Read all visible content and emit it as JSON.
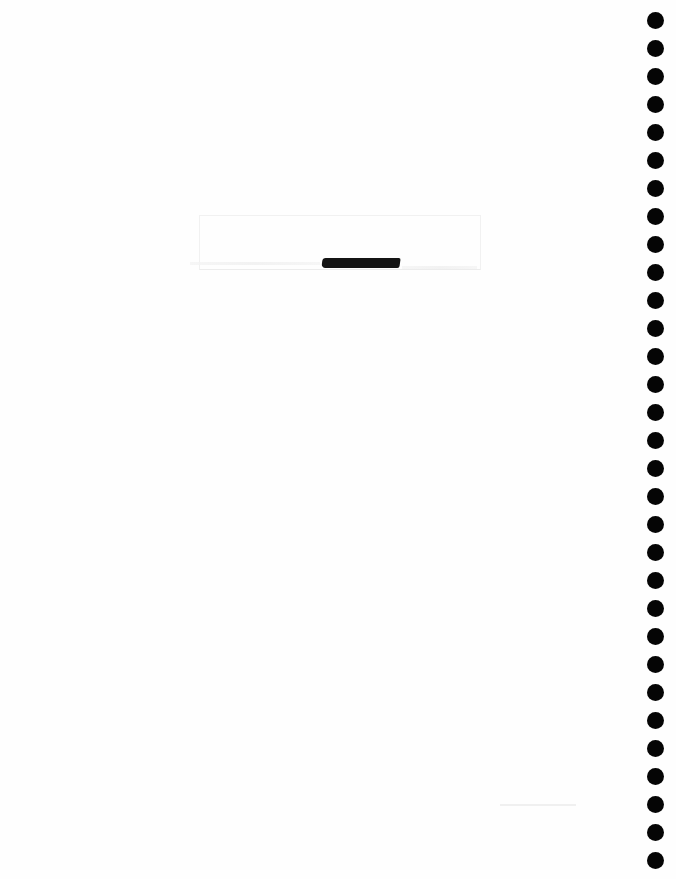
{
  "document": {
    "type": "scanned-page",
    "binding": "spiral",
    "binding_side": "right",
    "hole_count": 31,
    "redaction_count": 1,
    "text_content": "",
    "colors": {
      "paper": "#fefefe",
      "holes": "#050505",
      "redaction": "#141414"
    }
  }
}
